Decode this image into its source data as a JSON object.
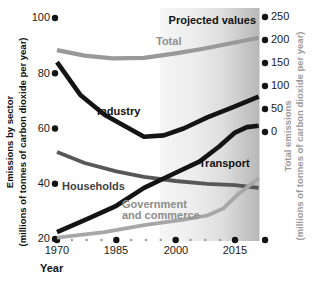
{
  "left_axis": {
    "title_line1": "Emissions by sector",
    "title_line2": "(millions of tonnes of carbon dioxide per year)",
    "ticks": [
      100,
      80,
      60,
      40,
      20
    ]
  },
  "right_axis": {
    "title_line1": "Total emissions",
    "title_line2": "(millions of tonnes of carbon dioxide per year)",
    "ticks": [
      250,
      200,
      150,
      100,
      50,
      0
    ]
  },
  "x_axis": {
    "title": "Year",
    "ticks": [
      1970,
      1985,
      2000,
      2015
    ]
  },
  "annotations": {
    "projected": "Projected values"
  },
  "series_labels": {
    "total": "Total",
    "industry": "Industry",
    "households": "Households",
    "transport": "Transport",
    "government_line1": "Government",
    "government_line2": "and commerce"
  },
  "colors": {
    "ink": "#141414",
    "total_line": "#999999",
    "households_line": "#575757",
    "government_line": "#a7a7a7",
    "small_dot": "#9d9d9d",
    "shade_gray": "#8c8c8c",
    "total_label": "#8f8f8f",
    "government_label": "#8d8d8d",
    "households_label": "#3f3f3f"
  },
  "chart_data": {
    "type": "line",
    "xlabel": "Year",
    "x_range": [
      1970,
      2021
    ],
    "left_axis": {
      "label": "Emissions by sector (millions of tonnes of carbon dioxide per year)",
      "range": [
        20,
        100
      ]
    },
    "right_axis": {
      "label": "Total emissions (millions of tonnes of carbon dioxide per year)",
      "range": [
        0,
        250
      ]
    },
    "projected_from_year": 1996,
    "end_dot_year": 2022.6,
    "legend_position": "inline-labels",
    "grid": false,
    "series": [
      {
        "name": "Total",
        "axis": "right",
        "color": "#999999",
        "width": 4.2,
        "points": [
          [
            1970,
            178
          ],
          [
            1977,
            166
          ],
          [
            1984,
            160
          ],
          [
            1992,
            161
          ],
          [
            2000,
            171
          ],
          [
            2007,
            181
          ],
          [
            2014,
            193
          ],
          [
            2021,
            205
          ]
        ]
      },
      {
        "name": "Industry",
        "axis": "left",
        "color": "#141414",
        "width": 4.6,
        "points": [
          [
            1970,
            84
          ],
          [
            1976,
            72
          ],
          [
            1982,
            65
          ],
          [
            1987,
            61
          ],
          [
            1992,
            57
          ],
          [
            1997,
            57.5
          ],
          [
            2002,
            60
          ],
          [
            2008,
            64
          ],
          [
            2015,
            68
          ],
          [
            2021,
            71.5
          ]
        ]
      },
      {
        "name": "Households",
        "axis": "left",
        "color": "#575757",
        "width": 3.8,
        "points": [
          [
            1970,
            51.5
          ],
          [
            1977,
            47.5
          ],
          [
            1985,
            44.5
          ],
          [
            1992,
            42.5
          ],
          [
            2000,
            41
          ],
          [
            2008,
            40
          ],
          [
            2015,
            39.5
          ],
          [
            2021,
            38.5
          ]
        ]
      },
      {
        "name": "Transport",
        "axis": "left",
        "color": "#141414",
        "width": 4.6,
        "points": [
          [
            1970,
            22.5
          ],
          [
            1978,
            27.5
          ],
          [
            1985,
            32
          ],
          [
            1992,
            38.5
          ],
          [
            2000,
            44
          ],
          [
            2006,
            48
          ],
          [
            2011,
            53.5
          ],
          [
            2015,
            58.5
          ],
          [
            2018,
            60.5
          ],
          [
            2021,
            61
          ]
        ]
      },
      {
        "name": "Government and commerce",
        "axis": "left",
        "color": "#a7a7a7",
        "width": 3.8,
        "points": [
          [
            1970,
            20.5
          ],
          [
            1982,
            22.5
          ],
          [
            1992,
            25
          ],
          [
            2002,
            27
          ],
          [
            2008,
            28.5
          ],
          [
            2012,
            31
          ],
          [
            2016,
            36.5
          ],
          [
            2021,
            42
          ]
        ]
      }
    ]
  }
}
